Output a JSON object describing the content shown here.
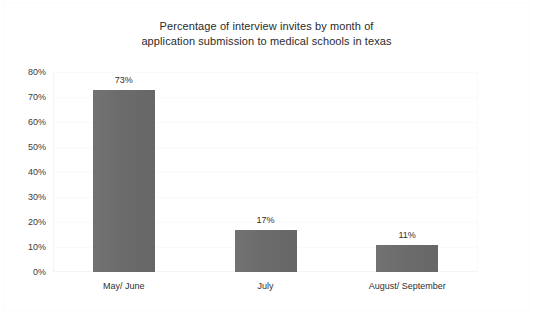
{
  "chart_data": {
    "type": "bar",
    "title": "Percentage of interview invites by month of\napplication submission to medical schools in texas",
    "title_line1": "Percentage of interview invites by month of",
    "title_line2": "application submission to medical schools in texas",
    "xlabel": "",
    "ylabel": "",
    "categories": [
      "May/ June",
      "July",
      "August/ September"
    ],
    "values": [
      73,
      17,
      11
    ],
    "value_labels": [
      "73%",
      "17%",
      "11%"
    ],
    "ylim": [
      0,
      80
    ],
    "ytick_values": [
      0,
      10,
      20,
      30,
      40,
      50,
      60,
      70,
      80
    ],
    "ytick_labels": [
      "0%",
      "10%",
      "20%",
      "30%",
      "40%",
      "50%",
      "60%",
      "70%",
      "80%"
    ],
    "grid": true,
    "legend": false,
    "series": [
      {
        "name": "Percentage of interview invites",
        "values": [
          73,
          17,
          11
        ],
        "color": "#6d6d6d"
      }
    ],
    "colors": {
      "bar": "#6d6d6d",
      "background": "#ffffff",
      "text": "#2f2f2f",
      "title_text": "#2b2b2b",
      "gridline": "#fafafb",
      "border": "#fbfbfc"
    }
  }
}
